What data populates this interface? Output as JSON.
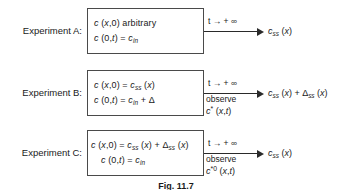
{
  "diagram": {
    "type": "flow-diagram",
    "caption": "Fig. 11.7",
    "arrow_label": "t → + ∞",
    "observe_label": "observe",
    "rows": [
      {
        "id": "experiment-a",
        "label": "Experiment A:",
        "conditions": {
          "initial_plain": "c (x,0) arbitrary",
          "boundary_plain": "c (0,t) = c_in"
        },
        "arrow_label": "t → + ∞",
        "observe": null,
        "observe_symbol": null,
        "output_plain": "c_ss (x)"
      },
      {
        "id": "experiment-b",
        "label": "Experiment B:",
        "conditions": {
          "initial_plain": "c (x,0) = c_ss (x)",
          "boundary_plain": "c (0,t) = c_in + Δ"
        },
        "arrow_label": "t → + ∞",
        "observe": "observe",
        "observe_symbol": "c* (x,t)",
        "output_plain": "c_ss (x) + Δ_ss (x)"
      },
      {
        "id": "experiment-c",
        "label": "Experiment C:",
        "conditions": {
          "initial_plain": "c (x,0) = c_ss (x) + Δ_ss (x)",
          "boundary_plain": "c (0,t) = c_in"
        },
        "arrow_label": "t → + ∞",
        "observe": "observe",
        "observe_symbol": "c*0 (x,t)",
        "output_plain": "c_ss (x)"
      }
    ]
  },
  "colors": {
    "background": "#ffffff",
    "box_border": "#4a4a4a",
    "arrow": "#2a2a2a",
    "text": "#1a1a1a"
  }
}
